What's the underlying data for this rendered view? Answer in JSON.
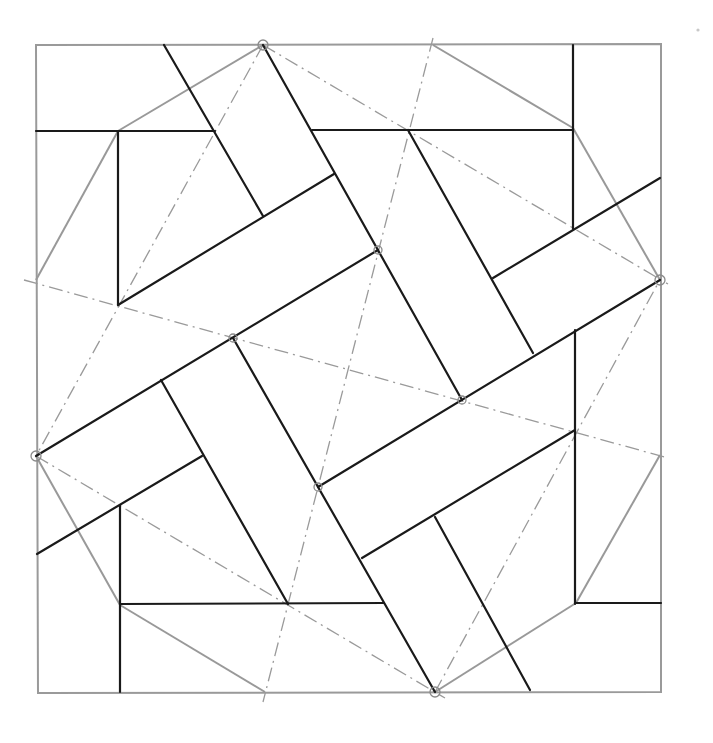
{
  "diagram": {
    "colors": {
      "frame": "#9a9a9a",
      "construction_lines": "#999999",
      "ink_lines": "#1a1a1a",
      "dash_dot_axes": "#9a9a9a",
      "background": "#ffffff"
    },
    "outer_square": [
      [
        36,
        45
      ],
      [
        661,
        44
      ],
      [
        661,
        692
      ],
      [
        38,
        693
      ]
    ],
    "octagon_edges": [
      [
        [
          263,
          45
        ],
        [
          118,
          131
        ]
      ],
      [
        [
          118,
          131
        ],
        [
          36,
          280
        ]
      ],
      [
        [
          36,
          456
        ],
        [
          120,
          605
        ]
      ],
      [
        [
          120,
          605
        ],
        [
          265,
          692
        ]
      ],
      [
        [
          435,
          692
        ],
        [
          576,
          603
        ]
      ],
      [
        [
          576,
          603
        ],
        [
          660,
          455
        ]
      ],
      [
        [
          660,
          280
        ],
        [
          573,
          128
        ]
      ],
      [
        [
          573,
          128
        ],
        [
          433,
          45
        ]
      ]
    ],
    "ink_lines": [
      [
        [
          36,
          131
        ],
        [
          215,
          131
        ]
      ],
      [
        [
          312,
          130
        ],
        [
          573,
          130
        ]
      ],
      [
        [
          573,
          45
        ],
        [
          573,
          229
        ]
      ],
      [
        [
          118,
          131
        ],
        [
          118,
          305
        ]
      ],
      [
        [
          164,
          45
        ],
        [
          263,
          216
        ]
      ],
      [
        [
          263,
          45
        ],
        [
          462,
          400
        ]
      ],
      [
        [
          408,
          130
        ],
        [
          533,
          353
        ]
      ],
      [
        [
          118,
          305
        ],
        [
          334,
          174
        ]
      ],
      [
        [
          36,
          456
        ],
        [
          378,
          250
        ]
      ],
      [
        [
          493,
          278
        ],
        [
          660,
          178
        ]
      ],
      [
        [
          233,
          338
        ],
        [
          435,
          692
        ]
      ],
      [
        [
          161,
          380
        ],
        [
          288,
          604
        ]
      ],
      [
        [
          37,
          554
        ],
        [
          202,
          456
        ]
      ],
      [
        [
          120,
          505
        ],
        [
          120,
          692
        ]
      ],
      [
        [
          120,
          604
        ],
        [
          384,
          603
        ]
      ],
      [
        [
          318,
          487
        ],
        [
          660,
          280
        ]
      ],
      [
        [
          362,
          558
        ],
        [
          575,
          430
        ]
      ],
      [
        [
          575,
          330
        ],
        [
          575,
          604
        ]
      ],
      [
        [
          575,
          603
        ],
        [
          661,
          603
        ]
      ],
      [
        [
          435,
          517
        ],
        [
          530,
          690
        ]
      ]
    ],
    "dash_dot_lines": [
      [
        [
          263,
          45
        ],
        [
          36,
          456
        ]
      ],
      [
        [
          263,
          45
        ],
        [
          668,
          284
        ]
      ],
      [
        [
          36,
          456
        ],
        [
          445,
          698
        ]
      ],
      [
        [
          435,
          692
        ],
        [
          662,
          276
        ]
      ],
      [
        [
          24,
          280
        ],
        [
          668,
          458
        ]
      ],
      [
        [
          433,
          38
        ],
        [
          263,
          702
        ]
      ]
    ],
    "nodes": [
      {
        "cx": 263,
        "cy": 45,
        "r": 5
      },
      {
        "cx": 660,
        "cy": 280,
        "r": 5
      },
      {
        "cx": 36,
        "cy": 456,
        "r": 5
      },
      {
        "cx": 435,
        "cy": 692,
        "r": 5
      },
      {
        "cx": 378,
        "cy": 250,
        "r": 4
      },
      {
        "cx": 233,
        "cy": 338,
        "r": 4
      },
      {
        "cx": 462,
        "cy": 400,
        "r": 4
      },
      {
        "cx": 318,
        "cy": 487,
        "r": 4
      }
    ]
  }
}
